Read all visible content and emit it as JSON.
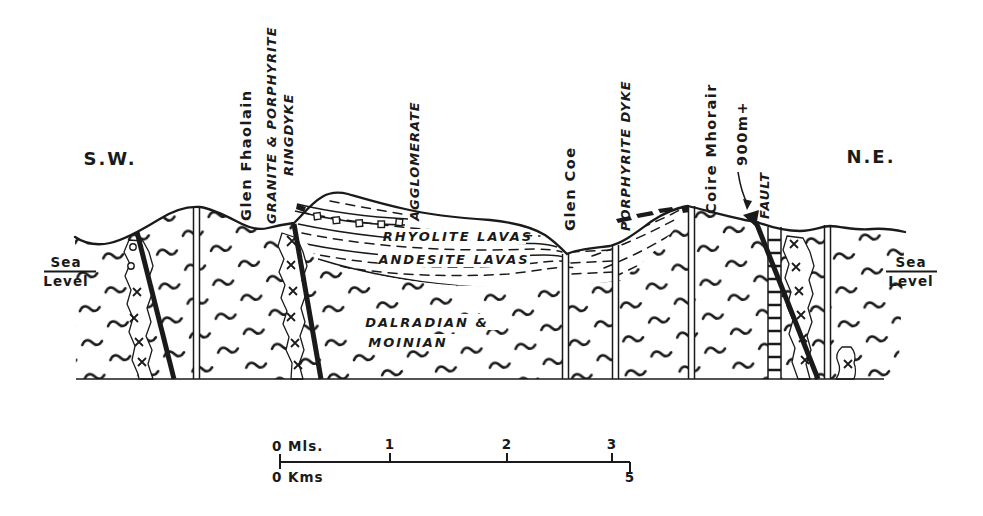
{
  "figure": {
    "kind": "geological cross-section",
    "colors": {
      "ink": "#1a1a1a",
      "paper": "#ffffff"
    },
    "compass": {
      "left": "S.W.",
      "right": "N.E."
    },
    "sea_level": {
      "line1": "Sea",
      "line2": "Level"
    },
    "annotations": {
      "glen_fhaolain": "Glen Fhaolain",
      "ringdyke_line1": "GRANITE & PORPHYRITE",
      "ringdyke_line2": "RINGDYKE",
      "agglomerate": "AGGLOMERATE",
      "glen_coe": "Glen Coe",
      "porphyrite_dyke": "PORPHYRITE DYKE",
      "coire_mhorair": "Coire Mhorair",
      "summit_height": "900m+",
      "fault": "FAULT"
    },
    "units": {
      "rhyolite": "RHYOLITE LAVAS",
      "andesite": "ANDESITE LAVAS",
      "basement_line1": "DALRADIAN &",
      "basement_line2": "MOINIAN"
    },
    "scale_bar": {
      "miles_zero": "0 Mls.",
      "mile_ticks": [
        "1",
        "2",
        "3"
      ],
      "kms_zero": "0 Kms",
      "kms_end": "5"
    }
  }
}
